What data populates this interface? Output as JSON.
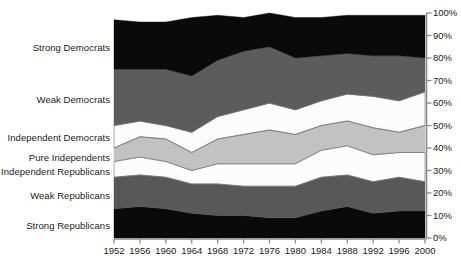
{
  "chart_data": {
    "type": "area",
    "title": "",
    "subtitle": "",
    "xlabel": "",
    "ylabel": "",
    "stacked": true,
    "normalized": true,
    "grid": false,
    "legend_position": "left-inline",
    "yaxis_side": "right",
    "ylim": [
      0,
      100
    ],
    "xlim": [
      1952,
      2000
    ],
    "x": [
      1952,
      1956,
      1960,
      1964,
      1968,
      1972,
      1976,
      1980,
      1984,
      1988,
      1992,
      1996,
      2000
    ],
    "xtick_labels": [
      "1952",
      "1956",
      "1960",
      "1964",
      "1968",
      "1972",
      "1976",
      "1980",
      "1984",
      "1988",
      "1992",
      "1996",
      "2000"
    ],
    "ytick_values": [
      0,
      10,
      20,
      30,
      40,
      50,
      60,
      70,
      80,
      90,
      100
    ],
    "ytick_labels": [
      "0%",
      "10%",
      "20%",
      "30%",
      "40%",
      "50%",
      "60%",
      "70%",
      "80%",
      "90%",
      "100%"
    ],
    "series": [
      {
        "name": "Strong Republicans",
        "color": "#0a0a0a",
        "values": [
          13,
          14,
          13,
          11,
          10,
          10,
          9,
          9,
          12,
          14,
          11,
          12,
          12
        ]
      },
      {
        "name": "Weak Republicans",
        "color": "#585858",
        "values": [
          14,
          14,
          14,
          13,
          14,
          13,
          14,
          14,
          15,
          14,
          14,
          15,
          13
        ]
      },
      {
        "name": "Independent Republicans",
        "color": "#fcfcfc",
        "values": [
          7,
          8,
          7,
          6,
          9,
          10,
          10,
          10,
          12,
          13,
          12,
          11,
          13
        ]
      },
      {
        "name": "Pure Independents",
        "color": "#c2c2c2",
        "values": [
          6,
          9,
          10,
          8,
          11,
          13,
          15,
          13,
          11,
          11,
          12,
          9,
          12
        ]
      },
      {
        "name": "Independent Democrats",
        "color": "#fcfcfc",
        "values": [
          10,
          7,
          6,
          9,
          10,
          11,
          12,
          11,
          11,
          12,
          14,
          14,
          15
        ]
      },
      {
        "name": "Weak Democrats",
        "color": "#5c5c5c",
        "values": [
          25,
          23,
          25,
          25,
          25,
          26,
          25,
          23,
          20,
          18,
          18,
          20,
          15
        ]
      },
      {
        "name": "Strong Democrats",
        "color": "#0a0a0a",
        "values": [
          22,
          21,
          21,
          26,
          20,
          15,
          15,
          18,
          17,
          17,
          18,
          18,
          19
        ]
      }
    ],
    "category_labels": [
      {
        "text": "Strong Democrats",
        "y_px": 48
      },
      {
        "text": "Weak Democrats",
        "y_px": 100
      },
      {
        "text": "Independent Democrats",
        "y_px": 138
      },
      {
        "text": "Pure Independents",
        "y_px": 158
      },
      {
        "text": "Independent Republicans",
        "y_px": 172
      },
      {
        "text": "Weak Republicans",
        "y_px": 196
      },
      {
        "text": "Strong Republicans",
        "y_px": 226
      }
    ],
    "axis_color": "#8a8a8a",
    "text_color": "#1a1a1a"
  }
}
